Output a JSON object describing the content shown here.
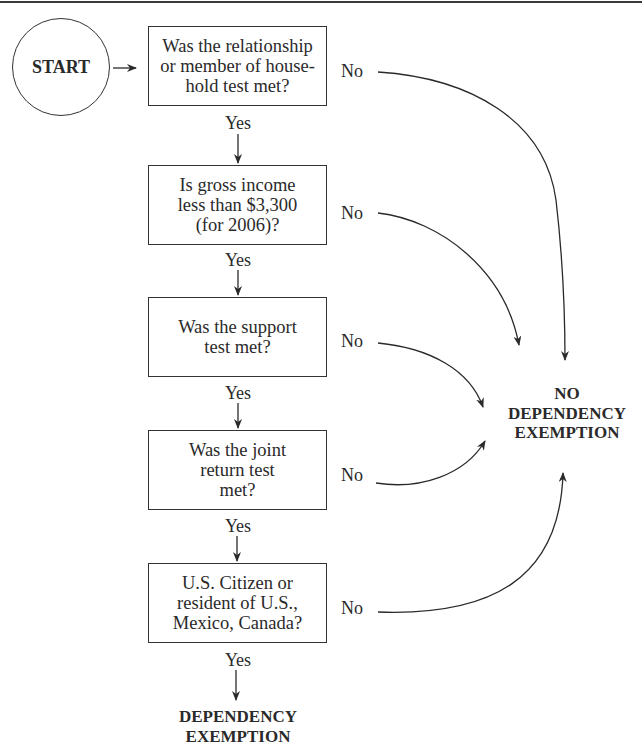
{
  "diagram": {
    "type": "flowchart",
    "start_label": "START",
    "decisions": [
      {
        "question": "Was the relationship\nor member of house-\nhold test met?",
        "yes_label": "Yes",
        "no_label": "No"
      },
      {
        "question": "Is gross income\nless than $3,300\n(for 2006)?",
        "yes_label": "Yes",
        "no_label": "No"
      },
      {
        "question": "Was the support\ntest met?",
        "yes_label": "Yes",
        "no_label": "No"
      },
      {
        "question": "Was the joint\nreturn test\nmet?",
        "yes_label": "Yes",
        "no_label": "No"
      },
      {
        "question": "U.S. Citizen or\nresident of U.S.,\nMexico, Canada?",
        "yes_label": "Yes",
        "no_label": "No"
      }
    ],
    "outcome_no": {
      "lines": [
        "NO",
        "DEPENDENCY",
        "EXEMPTION"
      ]
    },
    "outcome_yes": {
      "lines": [
        "DEPENDENCY",
        "EXEMPTION"
      ]
    }
  }
}
